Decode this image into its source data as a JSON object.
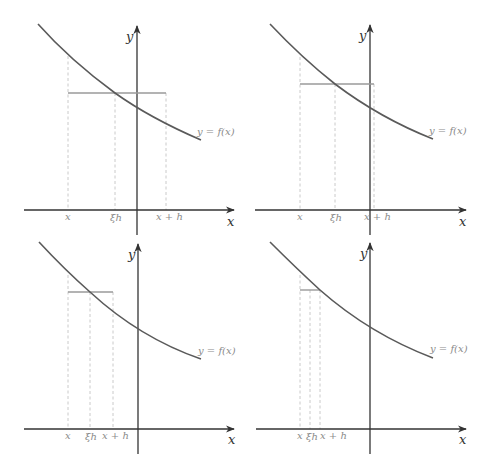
{
  "diagram": {
    "colors": {
      "axis": "#333333",
      "curve": "#5a5a5a",
      "mean_line": "#9a9a9a",
      "dashed": "#c4c4c4",
      "labels": "#8a8a8a"
    },
    "axis_labels": {
      "x": "x",
      "y": "y"
    },
    "function_label": "y = f(x)",
    "panels": [
      {
        "id": "panel-1",
        "labels": {
          "x": "x",
          "xi": "ξh",
          "xh": "x + h"
        },
        "offset": [
          0,
          0
        ],
        "x_axis_y": 210,
        "y_axis_x": 137,
        "x_pos": 68,
        "xi_pos": 115,
        "xh_pos": 166,
        "mean_y": 93
      },
      {
        "id": "panel-2",
        "labels": {
          "x": "x",
          "xi": "ξh",
          "xh": "x + h"
        },
        "offset": [
          232,
          -1
        ],
        "x_axis_y": 210,
        "y_axis_x": 370,
        "x_pos": 300,
        "xi_pos": 335,
        "xh_pos": 374,
        "mean_y": 84
      },
      {
        "id": "panel-3",
        "labels": {
          "x": "x",
          "xi": "ξh",
          "xh": "x + h"
        },
        "offset": [
          1,
          218
        ],
        "x_axis_y": 429,
        "y_axis_x": 138,
        "x_pos": 68,
        "xi_pos": 90,
        "xh_pos": 113,
        "mean_y": 292
      },
      {
        "id": "panel-4",
        "labels": {
          "x": "x",
          "xi": "ξh",
          "xh": "x + h"
        },
        "offset": [
          232,
          218
        ],
        "x_axis_y": 429,
        "y_axis_x": 370,
        "x_pos": 300,
        "xi_pos": 310,
        "xh_pos": 320,
        "mean_y": 290
      }
    ]
  }
}
